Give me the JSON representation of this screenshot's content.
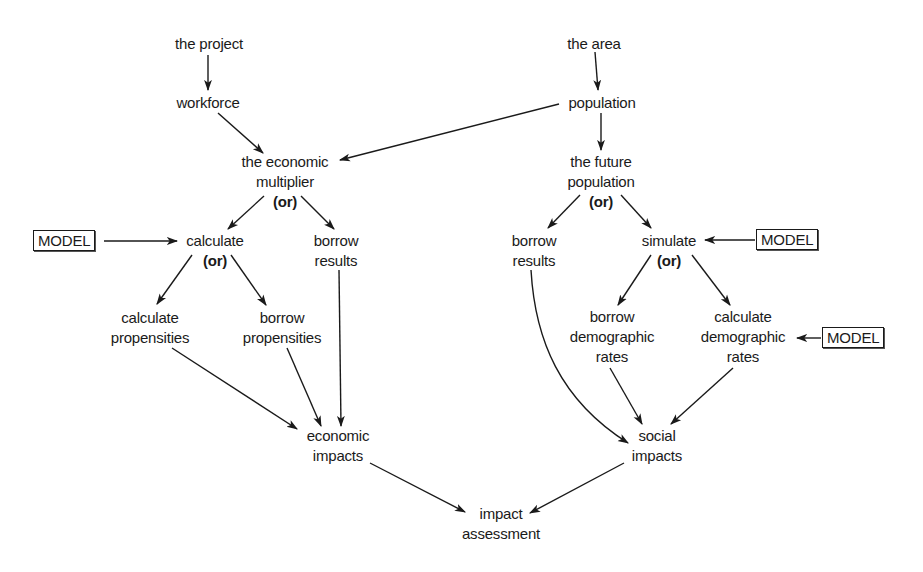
{
  "diagram": {
    "type": "flowchart",
    "nodes": {
      "project": {
        "lines": [
          "the project"
        ]
      },
      "workforce": {
        "lines": [
          "workforce"
        ]
      },
      "multiplier": {
        "lines": [
          "the economic",
          "multiplier"
        ],
        "or": "(or)"
      },
      "area": {
        "lines": [
          "the area"
        ]
      },
      "population": {
        "lines": [
          "population"
        ]
      },
      "future_population": {
        "lines": [
          "the future",
          "population"
        ],
        "or": "(or)"
      },
      "calculate": {
        "lines": [
          "calculate"
        ],
        "or": "(or)"
      },
      "borrow_results_left": {
        "lines": [
          "borrow",
          "results"
        ]
      },
      "borrow_results_right": {
        "lines": [
          "borrow",
          "results"
        ]
      },
      "simulate": {
        "lines": [
          "simulate"
        ],
        "or": "(or)"
      },
      "calculate_propensities": {
        "lines": [
          "calculate",
          "propensities"
        ]
      },
      "borrow_propensities": {
        "lines": [
          "borrow",
          "propensities"
        ]
      },
      "borrow_demographic_rates": {
        "lines": [
          "borrow",
          "demographic",
          "rates"
        ]
      },
      "calculate_demographic_rates": {
        "lines": [
          "calculate",
          "demographic",
          "rates"
        ]
      },
      "economic_impacts": {
        "lines": [
          "economic",
          "impacts"
        ]
      },
      "social_impacts": {
        "lines": [
          "social",
          "impacts"
        ]
      },
      "impact_assessment": {
        "lines": [
          "impact",
          "assessment"
        ]
      },
      "model_left": {
        "label": "MODEL"
      },
      "model_right_top": {
        "label": "MODEL"
      },
      "model_right_bottom": {
        "label": "MODEL"
      }
    },
    "edges": [
      [
        "project",
        "workforce"
      ],
      [
        "workforce",
        "multiplier"
      ],
      [
        "population",
        "multiplier"
      ],
      [
        "area",
        "population"
      ],
      [
        "population",
        "future_population"
      ],
      [
        "multiplier",
        "calculate"
      ],
      [
        "multiplier",
        "borrow_results_left"
      ],
      [
        "model_left",
        "calculate"
      ],
      [
        "calculate",
        "calculate_propensities"
      ],
      [
        "calculate",
        "borrow_propensities"
      ],
      [
        "calculate_propensities",
        "economic_impacts"
      ],
      [
        "borrow_propensities",
        "economic_impacts"
      ],
      [
        "borrow_results_left",
        "economic_impacts"
      ],
      [
        "future_population",
        "borrow_results_right"
      ],
      [
        "future_population",
        "simulate"
      ],
      [
        "model_right_top",
        "simulate"
      ],
      [
        "simulate",
        "borrow_demographic_rates"
      ],
      [
        "simulate",
        "calculate_demographic_rates"
      ],
      [
        "model_right_bottom",
        "calculate_demographic_rates"
      ],
      [
        "borrow_results_right",
        "social_impacts"
      ],
      [
        "borrow_demographic_rates",
        "social_impacts"
      ],
      [
        "calculate_demographic_rates",
        "social_impacts"
      ],
      [
        "economic_impacts",
        "impact_assessment"
      ],
      [
        "social_impacts",
        "impact_assessment"
      ]
    ]
  }
}
